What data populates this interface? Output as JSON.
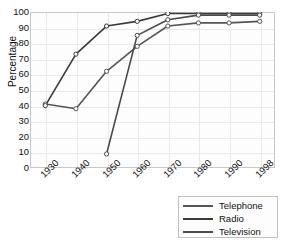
{
  "chart_data": {
    "type": "line",
    "title": "",
    "xlabel": "",
    "ylabel": "Percentage",
    "categories": [
      "1930",
      "1940",
      "1950",
      "1960",
      "1970",
      "1980",
      "1990",
      "1998"
    ],
    "x_values": [
      1930,
      1940,
      1950,
      1960,
      1970,
      1980,
      1990,
      1998
    ],
    "xlim": [
      1930,
      1998
    ],
    "ylim": [
      0,
      100
    ],
    "y_ticks": [
      0,
      10,
      20,
      30,
      40,
      50,
      60,
      70,
      80,
      90,
      100
    ],
    "grid": true,
    "legend_position": "bottom-right",
    "marker": "circle-open",
    "series": [
      {
        "name": "Telephone",
        "color": "#555555",
        "x": [
          1930,
          1940,
          1950,
          1960,
          1970,
          1980,
          1990,
          1998
        ],
        "values": [
          41,
          38,
          62,
          78,
          91,
          93,
          93,
          94
        ]
      },
      {
        "name": "Radio",
        "color": "#3a3a3a",
        "x": [
          1930,
          1940,
          1950,
          1960,
          1970,
          1980,
          1990,
          1998
        ],
        "values": [
          40,
          73,
          91,
          94,
          99,
          99,
          99,
          99
        ]
      },
      {
        "name": "Television",
        "color": "#4a4a4a",
        "x": [
          1950,
          1960,
          1970,
          1980,
          1990,
          1998
        ],
        "values": [
          9,
          85,
          95,
          98,
          98,
          98
        ]
      }
    ]
  },
  "axes": {
    "y_label": "Percentage",
    "y_ticks": [
      "100",
      "90",
      "80",
      "70",
      "60",
      "50",
      "40",
      "30",
      "20",
      "10",
      "0"
    ],
    "x_ticks": [
      "1930",
      "1940",
      "1950",
      "1960",
      "1970",
      "1980",
      "1990",
      "1998"
    ]
  },
  "legend": {
    "items": [
      {
        "label": "Telephone",
        "color": "#555555"
      },
      {
        "label": "Radio",
        "color": "#3a3a3a"
      },
      {
        "label": "Television",
        "color": "#4a4a4a"
      }
    ]
  }
}
